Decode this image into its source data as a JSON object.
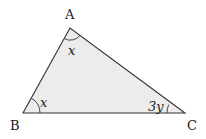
{
  "diagram": {
    "type": "triangle",
    "fill_color": "#ececec",
    "stroke_color": "#333333",
    "vertices": [
      {
        "name": "A",
        "x": 70,
        "y": 28,
        "label_x": 65,
        "label_y": 19
      },
      {
        "name": "B",
        "x": 23,
        "y": 113,
        "label_x": 10,
        "label_y": 130
      },
      {
        "name": "C",
        "x": 185,
        "y": 113,
        "label_x": 187,
        "label_y": 130
      }
    ],
    "angles": [
      {
        "vertex": "A",
        "label": "x",
        "label_x": 68,
        "label_y": 54
      },
      {
        "vertex": "B",
        "label": "x",
        "label_x": 40,
        "label_y": 106
      },
      {
        "vertex": "C",
        "label": "3y",
        "label_x": 148,
        "label_y": 111
      }
    ]
  },
  "labels": {
    "A": "A",
    "B": "B",
    "C": "C",
    "angle_A": "x",
    "angle_B": "x",
    "angle_C": "3y"
  }
}
